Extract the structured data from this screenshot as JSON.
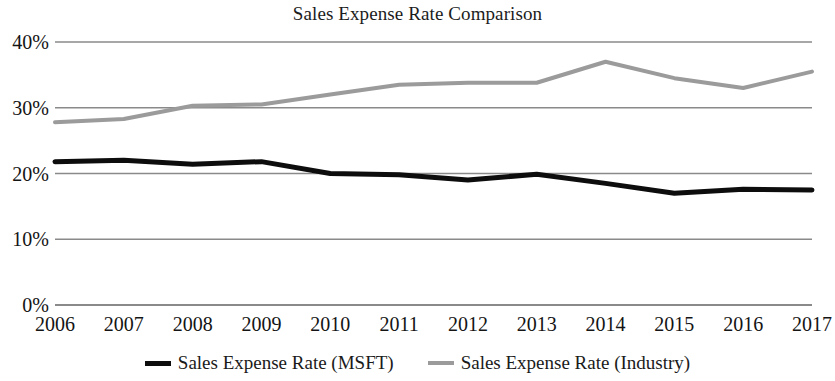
{
  "chart_data": {
    "type": "line",
    "title": "Sales Expense Rate Comparison",
    "xlabel": "",
    "ylabel": "",
    "x": [
      2006,
      2007,
      2008,
      2009,
      2010,
      2011,
      2012,
      2013,
      2014,
      2015,
      2016,
      2017
    ],
    "xtick_labels": [
      "2006",
      "2007",
      "2008",
      "2009",
      "2010",
      "2011",
      "2012",
      "2013",
      "2014",
      "2015",
      "2016",
      "2017"
    ],
    "ytick_labels": [
      "40%",
      "30%",
      "20%",
      "10%",
      "0%"
    ],
    "ytick_values": [
      40,
      30,
      20,
      10,
      0
    ],
    "ylim": [
      0,
      40
    ],
    "grid": "horizontal",
    "legend_position": "bottom-center",
    "series": [
      {
        "name": "Sales Expense Rate (MSFT)",
        "color": "#0d0d0d",
        "values": [
          21.8,
          22.0,
          21.4,
          21.8,
          20.0,
          19.8,
          19.0,
          19.9,
          18.5,
          17.0,
          17.6,
          17.5
        ]
      },
      {
        "name": "Sales Expense Rate (Industry)",
        "color": "#9b9b9b",
        "values": [
          27.8,
          28.3,
          30.3,
          30.5,
          32.0,
          33.5,
          33.8,
          33.8,
          37.0,
          34.5,
          33.0,
          35.5
        ]
      }
    ]
  },
  "legend": {
    "entries": [
      {
        "label": "Sales Expense Rate (MSFT)",
        "swatch": "msft"
      },
      {
        "label": "Sales Expense Rate (Industry)",
        "swatch": "industry"
      }
    ]
  },
  "colors": {
    "msft_line": "#0d0d0d",
    "industry_line": "#9b9b9b",
    "gridline": "#8a8a8a",
    "text": "#1a1a1a"
  }
}
